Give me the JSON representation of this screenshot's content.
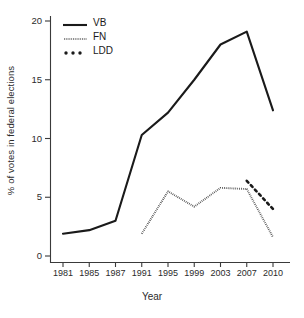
{
  "chart_data": {
    "type": "line",
    "title": "",
    "xlabel": "Year",
    "ylabel": "% of votes in federal elections",
    "categories": [
      "1981",
      "1985",
      "1987",
      "1991",
      "1995",
      "1999",
      "2003",
      "2007",
      "2010"
    ],
    "ylim": [
      0,
      21
    ],
    "yticks": [
      0,
      5,
      10,
      15,
      20
    ],
    "ytick_labels": [
      "0",
      "5",
      "10",
      "15",
      "20"
    ],
    "grid": false,
    "legend_position": "top-left",
    "series": [
      {
        "name": "VB",
        "style": "solid",
        "color": "#1a1a1a",
        "x": [
          "1981",
          "1985",
          "1987",
          "1991",
          "1995",
          "1999",
          "2003",
          "2007",
          "2010"
        ],
        "values": [
          1.9,
          2.2,
          3.0,
          10.3,
          12.2,
          15.0,
          18.0,
          19.1,
          12.4
        ]
      },
      {
        "name": "FN",
        "style": "fine-dotted",
        "color": "#1a1a1a",
        "x": [
          "1991",
          "1995",
          "1999",
          "2003",
          "2007",
          "2010"
        ],
        "values": [
          1.9,
          5.5,
          4.2,
          5.8,
          5.7,
          1.6
        ]
      },
      {
        "name": "LDD",
        "style": "bold-dotted",
        "color": "#1a1a1a",
        "x": [
          "2007",
          "2010"
        ],
        "values": [
          6.4,
          4.0
        ]
      }
    ]
  },
  "legend": {
    "items": [
      {
        "label": "VB",
        "style": "solid"
      },
      {
        "label": "FN",
        "style": "fine-dotted"
      },
      {
        "label": "LDD",
        "style": "bold-dotted"
      }
    ]
  },
  "axes": {
    "x_title": "Year",
    "y_title": "% of votes in federal elections"
  }
}
